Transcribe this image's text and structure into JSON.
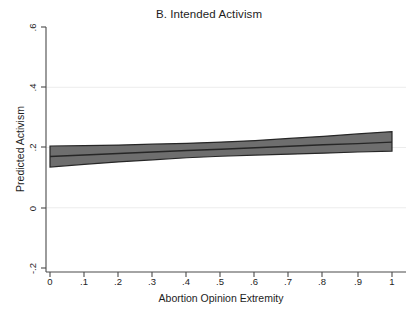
{
  "chart_data": {
    "type": "area",
    "title": "B. Intended Activism",
    "xlabel": "Abortion Opinion Extremity",
    "ylabel": "Predicted Activism",
    "xlim": [
      0,
      1
    ],
    "ylim": [
      -0.2,
      0.6
    ],
    "xticks": [
      0,
      0.1,
      0.2,
      0.3,
      0.4,
      0.5,
      0.6,
      0.7,
      0.8,
      0.9,
      1
    ],
    "xtick_labels": [
      "0",
      ".1",
      ".2",
      ".3",
      ".4",
      ".5",
      ".6",
      ".7",
      ".8",
      ".9",
      "1"
    ],
    "yticks": [
      -0.2,
      0,
      0.2,
      0.4,
      0.6
    ],
    "ytick_labels": [
      "-.2",
      "0",
      ".2",
      ".4",
      ".6"
    ],
    "grid": "horizontal",
    "gridlines_at": [
      0,
      0.2,
      0.4
    ],
    "legend": "none",
    "band_color": "#6e6e6e",
    "line_color": "#262626",
    "axis_color": "#4a4a4a",
    "grid_color": "#ececec",
    "background": "#ffffff",
    "series": [
      {
        "name": "Predicted Activism",
        "x": [
          0,
          0.1,
          0.2,
          0.3,
          0.4,
          0.5,
          0.6,
          0.7,
          0.8,
          0.9,
          1
        ],
        "values": [
          0.17,
          0.175,
          0.18,
          0.185,
          0.19,
          0.194,
          0.199,
          0.204,
          0.209,
          0.213,
          0.218
        ]
      },
      {
        "name": "95% CI upper",
        "x": [
          0,
          0.1,
          0.2,
          0.3,
          0.4,
          0.5,
          0.6,
          0.7,
          0.8,
          0.9,
          1
        ],
        "values": [
          0.205,
          0.206,
          0.208,
          0.211,
          0.214,
          0.218,
          0.223,
          0.23,
          0.237,
          0.245,
          0.253
        ]
      },
      {
        "name": "95% CI lower",
        "x": [
          0,
          0.1,
          0.2,
          0.3,
          0.4,
          0.5,
          0.6,
          0.7,
          0.8,
          0.9,
          1
        ],
        "values": [
          0.135,
          0.144,
          0.152,
          0.159,
          0.166,
          0.171,
          0.175,
          0.178,
          0.181,
          0.185,
          0.188
        ]
      }
    ]
  }
}
